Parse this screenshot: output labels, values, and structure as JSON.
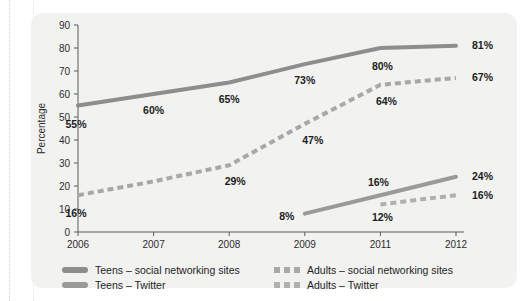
{
  "chart_data": {
    "type": "line",
    "title": "",
    "xlabel": "",
    "ylabel": "Percentage",
    "x": [
      "2006",
      "2007",
      "2008",
      "2009",
      "2011",
      "2012"
    ],
    "categories": [
      "2006",
      "2007",
      "2008",
      "2009",
      "2011",
      "2012"
    ],
    "ylim": [
      0,
      90
    ],
    "ytick_labels": [
      "0",
      "10",
      "20",
      "30",
      "40",
      "50",
      "60",
      "70",
      "80",
      "90"
    ],
    "ytick_values": [
      0,
      10,
      20,
      30,
      40,
      50,
      60,
      70,
      80,
      90
    ],
    "grid": false,
    "legend_position": "bottom",
    "series": [
      {
        "name": "Teens – social networking sites",
        "style": "solid",
        "color": "#8d8d8d",
        "values": [
          55,
          60,
          65,
          73,
          80,
          81
        ],
        "point_labels": [
          "55%",
          "60%",
          "65%",
          "73%",
          "80%",
          "81%"
        ]
      },
      {
        "name": "Adults – social networking sites",
        "style": "dashed",
        "color": "#a8a8a8",
        "values": [
          16,
          22,
          29,
          47,
          64,
          67
        ],
        "point_labels": [
          "16%",
          null,
          "29%",
          "47%",
          "64%",
          "67%"
        ]
      },
      {
        "name": "Teens – Twitter",
        "style": "solid",
        "color": "#9a9a9a",
        "values": [
          null,
          null,
          null,
          8,
          16,
          24
        ],
        "point_labels": [
          null,
          null,
          null,
          "8%",
          "16%",
          "24%"
        ]
      },
      {
        "name": "Adults – Twitter",
        "style": "dashed",
        "color": "#b0b0b0",
        "values": [
          null,
          null,
          null,
          null,
          12,
          16
        ],
        "point_labels": [
          null,
          null,
          null,
          null,
          "12%",
          "16%"
        ]
      }
    ]
  },
  "legend": {
    "items": [
      {
        "label": "Teens – social networking sites",
        "style": "solid",
        "color": "#8d8d8d"
      },
      {
        "label": "Adults – social networking sites",
        "style": "dashed",
        "color": "#a8a8a8"
      },
      {
        "label": "Teens – Twitter",
        "style": "solid",
        "color": "#9a9a9a"
      },
      {
        "label": "Adults – Twitter",
        "style": "dashed",
        "color": "#b0b0b0"
      }
    ]
  },
  "axis": {
    "y_title": "Percentage"
  }
}
